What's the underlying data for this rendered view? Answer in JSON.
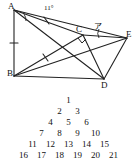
{
  "figure": {
    "vertices": [
      {
        "id": "A",
        "label": "A",
        "x": 14,
        "y": 10
      },
      {
        "id": "B",
        "label": "B",
        "x": 14,
        "y": 76
      },
      {
        "id": "C",
        "label": "C",
        "x": 83,
        "y": 35
      },
      {
        "id": "D",
        "label": "D",
        "x": 104,
        "y": 79
      },
      {
        "id": "E",
        "label": "E",
        "x": 127,
        "y": 38
      }
    ],
    "vertex_labels": [
      {
        "name": "vertex-label-a",
        "text": "A",
        "left": 8,
        "top": 2
      },
      {
        "name": "vertex-label-b",
        "text": "B",
        "left": 7,
        "top": 69
      },
      {
        "name": "vertex-label-c",
        "text": "C",
        "left": 76,
        "top": 25
      },
      {
        "name": "vertex-label-d",
        "text": "D",
        "left": 101,
        "top": 81
      },
      {
        "name": "vertex-label-e",
        "text": "E",
        "left": 126,
        "top": 30
      }
    ],
    "angle_label": {
      "text": "11°",
      "left": 44,
      "top": 5
    },
    "mark_label": {
      "text": "ア",
      "left": 94,
      "top": 24
    },
    "segments": [
      {
        "name": "segment-ab",
        "from": "A",
        "to": "B"
      },
      {
        "name": "segment-ac",
        "from": "A",
        "to": "C"
      },
      {
        "name": "segment-ad",
        "from": "A",
        "to": "D"
      },
      {
        "name": "segment-bc",
        "from": "B",
        "to": "C"
      },
      {
        "name": "segment-bd",
        "from": "B",
        "to": "D"
      },
      {
        "name": "segment-be",
        "from": "B",
        "to": "E"
      },
      {
        "name": "segment-cd",
        "from": "C",
        "to": "D"
      },
      {
        "name": "segment-ce",
        "from": "C",
        "to": "E"
      },
      {
        "name": "segment-de",
        "from": "D",
        "to": "E"
      }
    ],
    "tick_marks": [
      {
        "name": "tick-mark-ab",
        "on": "AB"
      },
      {
        "name": "tick-mark-ac",
        "on": "AC"
      },
      {
        "name": "tick-mark-bc",
        "on": "BC"
      }
    ],
    "right_angle": {
      "name": "right-angle-mark-c",
      "at": "C"
    }
  },
  "number_triangle": {
    "rows": [
      [
        "1"
      ],
      [
        "2",
        "3"
      ],
      [
        "4",
        "5",
        "6"
      ],
      [
        "7",
        "8",
        "9",
        "10"
      ],
      [
        "11",
        "12",
        "13",
        "14",
        "15"
      ],
      [
        "16",
        "17",
        "18",
        "19",
        "20",
        "21"
      ]
    ]
  },
  "colors": {
    "ink": "#111111",
    "paper": "#ffffff"
  }
}
